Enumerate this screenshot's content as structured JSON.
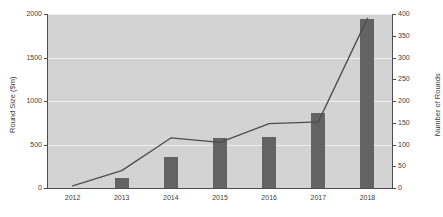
{
  "chart_data": {
    "type": "bar",
    "title": "",
    "categories": [
      "2012",
      "2013",
      "2014",
      "2015",
      "2016",
      "2017",
      "2018"
    ],
    "xlabel": "",
    "series": [
      {
        "name": "Round Size ($m)",
        "type": "bar",
        "axis": "left",
        "values": [
          0,
          120,
          360,
          580,
          590,
          860,
          1940
        ],
        "color": "#636363"
      },
      {
        "name": "Number of Rounds",
        "type": "line",
        "axis": "right",
        "values": [
          5,
          40,
          115,
          105,
          148,
          152,
          390
        ],
        "color": "#4d4d4d"
      }
    ],
    "left_axis": {
      "label": "Round Size ($m)",
      "ticks": [
        0,
        500,
        1000,
        1500,
        2000
      ],
      "lim": [
        0,
        2000
      ]
    },
    "right_axis": {
      "label": "Number of Rounds",
      "ticks": [
        0,
        50,
        100,
        150,
        200,
        250,
        300,
        350,
        400
      ],
      "lim": [
        0,
        400
      ]
    },
    "grid": true,
    "legend": "none",
    "plot_background": "#d3d3d3"
  }
}
